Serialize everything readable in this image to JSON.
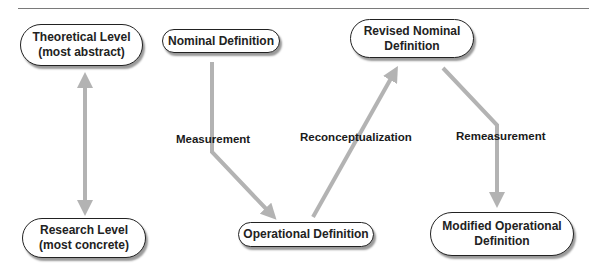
{
  "header": {
    "text": "FIGURE"
  },
  "nodes": {
    "theoretical": "Theoretical Level\n(most abstract)",
    "research": "Research Level\n(most concrete)",
    "nominal": "Nominal Definition",
    "operational": "Operational Definition",
    "revised": "Revised Nominal\nDefinition",
    "modified": "Modified Operational\nDefinition"
  },
  "edges": {
    "measurement": "Measurement",
    "reconceptualization": "Reconceptualization",
    "remeasurement": "Remeasurement"
  },
  "colors": {
    "arrow": "#b3b3b3",
    "border": "#222222",
    "shadow": "#9a9a9a"
  }
}
